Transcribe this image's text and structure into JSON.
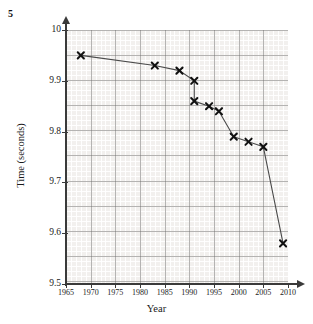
{
  "question_number": "5",
  "chart_data": {
    "type": "line",
    "title": "",
    "xlabel": "Year",
    "ylabel": "Time (seconds)",
    "xlim": [
      1965,
      2010
    ],
    "ylim": [
      9.5,
      10.0
    ],
    "grid": true,
    "legend": "none",
    "marker": "x",
    "xticks": [
      1965,
      1970,
      1975,
      1980,
      1985,
      1990,
      1995,
      2000,
      2005,
      2010
    ],
    "xtick_labels": [
      "1965",
      "1970",
      "1975",
      "1980",
      "1985",
      "1990",
      "1995",
      "2000",
      "2005",
      "2010"
    ],
    "yticks": [
      9.5,
      9.6,
      9.7,
      9.8,
      9.9,
      10.0
    ],
    "ytick_labels": [
      "9.5",
      "9.6",
      "9.7",
      "9.8",
      "9.9",
      "10"
    ],
    "x": [
      1968,
      1983,
      1988,
      1991,
      1991,
      1994,
      1996,
      1999,
      2002,
      2005,
      2009
    ],
    "y": [
      9.95,
      9.93,
      9.92,
      9.9,
      9.86,
      9.85,
      9.84,
      9.79,
      9.78,
      9.77,
      9.58
    ],
    "points": [
      {
        "x": 1968,
        "y": 9.95
      },
      {
        "x": 1983,
        "y": 9.93
      },
      {
        "x": 1988,
        "y": 9.92
      },
      {
        "x": 1991,
        "y": 9.9
      },
      {
        "x": 1991,
        "y": 9.86
      },
      {
        "x": 1994,
        "y": 9.85
      },
      {
        "x": 1996,
        "y": 9.84
      },
      {
        "x": 1999,
        "y": 9.79
      },
      {
        "x": 2002,
        "y": 9.78
      },
      {
        "x": 2005,
        "y": 9.77
      },
      {
        "x": 2009,
        "y": 9.58
      }
    ],
    "series": [
      {
        "name": "Record time",
        "values": [
          9.95,
          9.93,
          9.92,
          9.9,
          9.86,
          9.85,
          9.84,
          9.79,
          9.78,
          9.77,
          9.58
        ]
      }
    ],
    "colors": {
      "line": "#4a4a4a",
      "marker": "#111111",
      "plot_background": "#f2f0ee",
      "grid_minor": "#ffffff",
      "grid_major": "#787674",
      "axis": "#3a3a3a"
    }
  }
}
